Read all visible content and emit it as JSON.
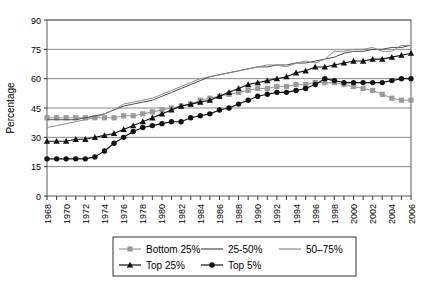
{
  "chart_data": {
    "type": "line",
    "title": "",
    "xlabel": "",
    "ylabel": "Percentage",
    "ylim": [
      0,
      90
    ],
    "yticks": [
      0,
      15,
      30,
      45,
      60,
      75,
      90
    ],
    "grid": true,
    "legend_position": "bottom",
    "x": [
      1968,
      1969,
      1970,
      1971,
      1972,
      1973,
      1974,
      1975,
      1976,
      1977,
      1978,
      1979,
      1980,
      1981,
      1982,
      1983,
      1984,
      1985,
      1986,
      1987,
      1988,
      1989,
      1990,
      1991,
      1992,
      1993,
      1994,
      1995,
      1996,
      1997,
      1998,
      1999,
      2000,
      2001,
      2002,
      2003,
      2004,
      2005,
      2006
    ],
    "xticklabels": [
      "1968",
      "1970",
      "1972",
      "1974",
      "1976",
      "1978",
      "1980",
      "1982",
      "1984",
      "1986",
      "1988",
      "1990",
      "1992",
      "1994",
      "1996",
      "1998",
      "2000",
      "2002",
      "2004",
      "2006"
    ],
    "xlim": [
      1968,
      2006
    ],
    "series": [
      {
        "name": "Bottom 25%",
        "marker": "square",
        "color": "#9a9a9a",
        "line_color": "#9a9a9a",
        "values": [
          40,
          40,
          40,
          40,
          40,
          40,
          40,
          40,
          41,
          41,
          42,
          43,
          44,
          45,
          46,
          47,
          49,
          50,
          51,
          52,
          53,
          54,
          55,
          55,
          56,
          56,
          57,
          57,
          58,
          58,
          58,
          57,
          56,
          55,
          54,
          52,
          50,
          49,
          49
        ]
      },
      {
        "name": "25-50%",
        "marker": "none",
        "color": "#4a4a4a",
        "line_color": "#4a4a4a",
        "values": [
          39,
          39,
          39,
          39,
          40,
          41,
          42,
          44,
          46,
          47,
          48,
          49,
          51,
          53,
          55,
          57,
          59,
          61,
          62,
          63,
          64,
          65,
          66,
          66,
          67,
          67,
          68,
          68,
          69,
          70,
          71,
          73,
          74,
          74,
          75,
          75,
          76,
          76,
          77
        ]
      },
      {
        "name": "50–75%",
        "marker": "none",
        "color": "#8c8c8c",
        "line_color": "#8c8c8c",
        "values": [
          35,
          36,
          37,
          38,
          39,
          40,
          42,
          44,
          47,
          48,
          49,
          50,
          52,
          54,
          56,
          58,
          60,
          61,
          62,
          63,
          64,
          65,
          66,
          67,
          67,
          66,
          68,
          69,
          68,
          70,
          74,
          74,
          75,
          75,
          76,
          74,
          74,
          77,
          77
        ]
      },
      {
        "name": "Top 25%",
        "marker": "triangle",
        "color": "#111111",
        "line_color": "#111111",
        "values": [
          28,
          28,
          28,
          29,
          29,
          30,
          31,
          32,
          34,
          36,
          38,
          40,
          42,
          44,
          46,
          47,
          48,
          49,
          51,
          53,
          55,
          57,
          58,
          59,
          60,
          61,
          63,
          64,
          66,
          66,
          67,
          68,
          69,
          69,
          70,
          70,
          71,
          72,
          73
        ]
      },
      {
        "name": "Top 5%",
        "marker": "circle",
        "color": "#111111",
        "line_color": "#111111",
        "values": [
          19,
          19,
          19,
          19,
          19,
          20,
          23,
          27,
          30,
          33,
          35,
          36,
          37,
          38,
          38,
          40,
          41,
          42,
          44,
          45,
          47,
          49,
          51,
          52,
          53,
          53,
          54,
          55,
          57,
          60,
          59,
          58,
          58,
          58,
          58,
          58,
          59,
          60,
          60
        ]
      }
    ]
  },
  "legend": {
    "items": [
      {
        "label": "Bottom 25%"
      },
      {
        "label": "25-50%"
      },
      {
        "label": "50–75%"
      },
      {
        "label": "Top 25%"
      },
      {
        "label": "Top 5%"
      }
    ]
  },
  "caption": {
    "text": ""
  }
}
